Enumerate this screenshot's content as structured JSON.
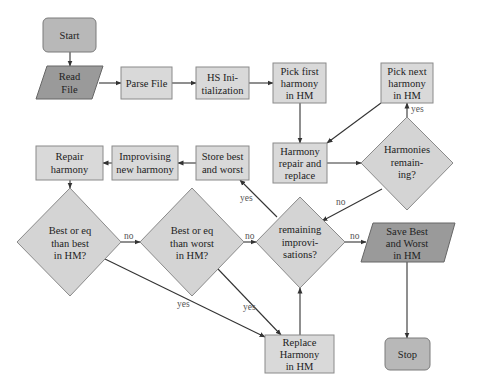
{
  "diagram": {
    "type": "flowchart",
    "nodes": {
      "start": {
        "kind": "terminal",
        "lines": [
          "Start"
        ]
      },
      "read_file": {
        "kind": "io",
        "lines": [
          "Read",
          "File"
        ]
      },
      "parse_file": {
        "kind": "process",
        "lines": [
          "Parse File"
        ]
      },
      "hs_init": {
        "kind": "process",
        "lines": [
          "HS Ini-",
          "tialization"
        ]
      },
      "pick_first": {
        "kind": "process",
        "lines": [
          "Pick first",
          "harmony",
          "in HM"
        ]
      },
      "pick_next": {
        "kind": "process",
        "lines": [
          "Pick next",
          "harmony",
          "in HM"
        ]
      },
      "harmony_repair": {
        "kind": "process",
        "lines": [
          "Harmony",
          "repair and",
          "replace"
        ]
      },
      "harmonies_remaining": {
        "kind": "decision",
        "lines": [
          "Harmonies",
          "remain-",
          "ing?"
        ]
      },
      "store_best": {
        "kind": "process",
        "lines": [
          "Store best",
          "and worst"
        ]
      },
      "improvising": {
        "kind": "process",
        "lines": [
          "Improvising",
          "new harmony"
        ]
      },
      "repair_harmony": {
        "kind": "process",
        "lines": [
          "Repair",
          "harmony"
        ]
      },
      "best_than_best": {
        "kind": "decision",
        "lines": [
          "Best or eq",
          "than best",
          "in HM?"
        ]
      },
      "best_than_worst": {
        "kind": "decision",
        "lines": [
          "Best or eq",
          "than worst",
          "in HM?"
        ]
      },
      "remaining_improv": {
        "kind": "decision",
        "lines": [
          "remaining",
          "improvi-",
          "sations?"
        ]
      },
      "save_best": {
        "kind": "io",
        "lines": [
          "Save Best",
          "and Worst",
          "in HM"
        ]
      },
      "replace_harmony": {
        "kind": "process",
        "lines": [
          "Replace",
          "Harmony",
          "in HM"
        ]
      },
      "stop": {
        "kind": "terminal",
        "lines": [
          "Stop"
        ]
      }
    },
    "edges": [
      {
        "from": "start",
        "to": "read_file",
        "label": ""
      },
      {
        "from": "read_file",
        "to": "parse_file",
        "label": ""
      },
      {
        "from": "parse_file",
        "to": "hs_init",
        "label": ""
      },
      {
        "from": "hs_init",
        "to": "pick_first",
        "label": ""
      },
      {
        "from": "pick_first",
        "to": "harmony_repair",
        "label": ""
      },
      {
        "from": "harmony_repair",
        "to": "harmonies_remaining",
        "label": ""
      },
      {
        "from": "harmonies_remaining",
        "to": "pick_next",
        "label": "yes"
      },
      {
        "from": "pick_next",
        "to": "harmony_repair",
        "label": ""
      },
      {
        "from": "harmonies_remaining",
        "to": "remaining_improv",
        "label": "no"
      },
      {
        "from": "remaining_improv",
        "to": "store_best",
        "label": "yes"
      },
      {
        "from": "store_best",
        "to": "improvising",
        "label": ""
      },
      {
        "from": "improvising",
        "to": "repair_harmony",
        "label": ""
      },
      {
        "from": "repair_harmony",
        "to": "best_than_best",
        "label": ""
      },
      {
        "from": "best_than_best",
        "to": "best_than_worst",
        "label": "no"
      },
      {
        "from": "best_than_worst",
        "to": "remaining_improv",
        "label": "no"
      },
      {
        "from": "best_than_best",
        "to": "replace_harmony",
        "label": "yes"
      },
      {
        "from": "best_than_worst",
        "to": "replace_harmony",
        "label": "yes"
      },
      {
        "from": "replace_harmony",
        "to": "remaining_improv",
        "label": ""
      },
      {
        "from": "remaining_improv",
        "to": "save_best",
        "label": "no"
      },
      {
        "from": "save_best",
        "to": "stop",
        "label": ""
      }
    ],
    "labels": {
      "yes": "yes",
      "no": "no"
    }
  }
}
